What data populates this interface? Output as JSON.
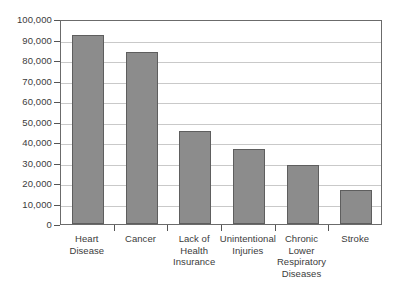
{
  "chart_data": {
    "type": "bar",
    "title": "",
    "subtitle": "",
    "xlabel": "",
    "ylabel": "",
    "categories": [
      "Heart Disease",
      "Cancer",
      "Lack of Health Insurance",
      "Unintentional Injuries",
      "Chronic Lower Respiratory Diseases",
      "Stroke"
    ],
    "category_lines": [
      [
        "Heart",
        "Disease"
      ],
      [
        "Cancer"
      ],
      [
        "Lack of",
        "Health",
        "Insurance"
      ],
      [
        "Unintentional",
        "Injuries"
      ],
      [
        "Chronic",
        "Lower",
        "Respiratory",
        "Diseases"
      ],
      [
        "Stroke"
      ]
    ],
    "values": [
      92000,
      84000,
      45500,
      36500,
      29000,
      16500
    ],
    "ylim": [
      0,
      100000
    ],
    "ytick_values": [
      0,
      10000,
      20000,
      30000,
      40000,
      50000,
      60000,
      70000,
      80000,
      90000,
      100000
    ],
    "ytick_labels": [
      "0",
      "10,000",
      "20,000",
      "30,000",
      "40,000",
      "50,000",
      "60,000",
      "70,000",
      "80,000",
      "90,000",
      "100,000"
    ],
    "grid": true,
    "legend": false,
    "legend_position": "none",
    "series": [
      {
        "name": "",
        "values": [
          92000,
          84000,
          45500,
          36500,
          29000,
          16500
        ]
      }
    ],
    "colors": {
      "bar_fill": "#8c8c8c",
      "bar_border": "#5e5e5e",
      "gridline": "#c9c9c9",
      "axis": "#6b6b6b",
      "text": "#3b3b3b",
      "background": "#ffffff"
    }
  }
}
